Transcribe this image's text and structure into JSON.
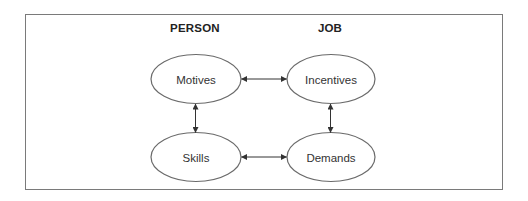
{
  "columns": {
    "left": {
      "label": "PERSON",
      "x": 195,
      "y": 29
    },
    "right": {
      "label": "JOB",
      "x": 330,
      "y": 29
    }
  },
  "nodes": [
    {
      "id": "motives",
      "label": "Motives",
      "cx": 196,
      "cy": 79,
      "rx": 45,
      "ry": 24.5,
      "column": "PERSON"
    },
    {
      "id": "incentives",
      "label": "Incentives",
      "cx": 331,
      "cy": 79,
      "rx": 44,
      "ry": 24.5,
      "column": "JOB"
    },
    {
      "id": "skills",
      "label": "Skills",
      "cx": 196,
      "cy": 157,
      "rx": 45,
      "ry": 24.5,
      "column": "PERSON"
    },
    {
      "id": "demands",
      "label": "Demands",
      "cx": 331,
      "cy": 157,
      "rx": 44,
      "ry": 24.5,
      "column": "JOB"
    }
  ],
  "edges": [
    {
      "from": "motives",
      "to": "incentives",
      "bidirectional": true
    },
    {
      "from": "motives",
      "to": "skills",
      "bidirectional": true
    },
    {
      "from": "incentives",
      "to": "demands",
      "bidirectional": true
    },
    {
      "from": "skills",
      "to": "demands",
      "bidirectional": true
    }
  ],
  "colors": {
    "frame": "#7a7a7a",
    "ellipse_stroke": "#6a6a6a",
    "arrow": "#333333",
    "heading_text": "#222222",
    "node_text": "#333333"
  }
}
